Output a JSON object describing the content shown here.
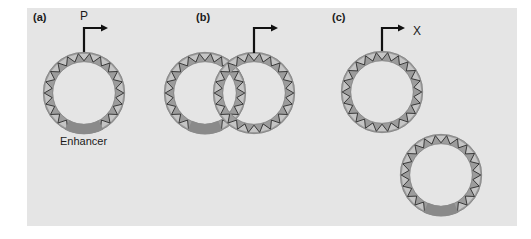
{
  "figure": {
    "panels": [
      {
        "id": "a",
        "letter": "(a)",
        "promoter_label": "P",
        "enhancer_label": "Enhancer",
        "description": "Single circular DNA with promoter arrow at top and enhancer segment at bottom"
      },
      {
        "id": "b",
        "letter": "(b)",
        "description": "Two interlocked (catenated) DNA circles; enhancer on left circle, promoter arrow on right circle"
      },
      {
        "id": "c",
        "letter": "(c)",
        "promoter_label": "X",
        "description": "Two separate DNA circles; promoter arrow on upper circle, enhancer on lower circle"
      }
    ],
    "colors": {
      "background": "#e5e5e5",
      "ring_band": "#9c9c9c",
      "zigzag": "#2b2b2b",
      "triangle_fill": "#d0d0d0",
      "enhancer": "#8a8a8a",
      "arrow": "#111111"
    }
  }
}
